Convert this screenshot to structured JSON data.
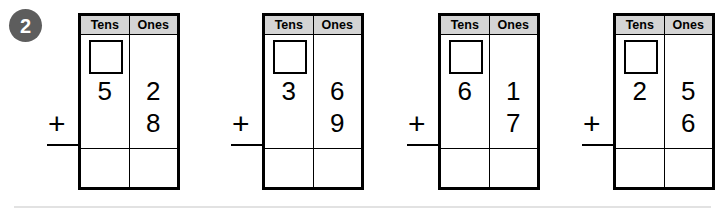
{
  "worksheet": {
    "problem_number": "2",
    "bottom_rule": true,
    "colors": {
      "badge_background": "#5d5d5d",
      "badge_text": "#ffffff",
      "header_background": "#d4d4d4",
      "grid_line": "#000000",
      "bottom_rule": "#e2e2e2"
    },
    "columns": {
      "tens_label": "Tens",
      "ones_label": "Ones"
    },
    "operator": "+",
    "problems": [
      {
        "id": "problem-1",
        "left": 78,
        "tens_regroup_box": "",
        "tens_digit": "5",
        "ones_top_digit": "2",
        "ones_bottom_digit": "8",
        "answer_tens": "",
        "answer_ones": ""
      },
      {
        "id": "problem-2",
        "left": 262,
        "tens_regroup_box": "",
        "tens_digit": "3",
        "ones_top_digit": "6",
        "ones_bottom_digit": "9",
        "answer_tens": "",
        "answer_ones": ""
      },
      {
        "id": "problem-3",
        "left": 438,
        "tens_regroup_box": "",
        "tens_digit": "6",
        "ones_top_digit": "1",
        "ones_bottom_digit": "7",
        "answer_tens": "",
        "answer_ones": ""
      },
      {
        "id": "problem-4",
        "left": 613,
        "tens_regroup_box": "",
        "tens_digit": "2",
        "ones_top_digit": "5",
        "ones_bottom_digit": "6",
        "answer_tens": "",
        "answer_ones": ""
      }
    ]
  }
}
